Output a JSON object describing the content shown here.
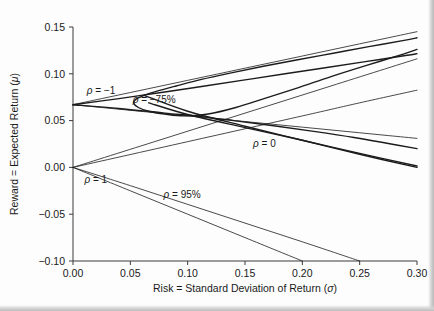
{
  "figure": {
    "background": "#fdfdfd",
    "curve_color": "#1c1c1c"
  },
  "chart_data": {
    "type": "line",
    "title": "",
    "subtitle": "",
    "xlabel": "Risk = Standard Deviation of Return (σ)",
    "ylabel": "Reward = Expected Return (μ)",
    "xlim": [
      0.0,
      0.3
    ],
    "ylim": [
      -0.1,
      0.15
    ],
    "xticks": [
      0.0,
      0.05,
      0.1,
      0.15,
      0.2,
      0.25,
      0.3
    ],
    "xtick_labels": [
      "0.00",
      "0.05",
      "0.10",
      "0.15",
      "0.20",
      "0.25",
      "0.30"
    ],
    "yticks": [
      -0.1,
      -0.05,
      0.0,
      0.05,
      0.1,
      0.15
    ],
    "ytick_labels": [
      "-0.10",
      "-0.05",
      "0.00",
      "0.05",
      "0.10",
      "0.15"
    ],
    "grid": false,
    "legend": "inline-annotations",
    "assets": {
      "asset_a": {
        "sigma": 0.2,
        "mu": 0.067
      },
      "asset_b": {
        "sigma": 0.25,
        "mu": 0.115
      }
    },
    "annotations": [
      {
        "text": "ρ = −1",
        "x": 0.012,
        "y": 0.078,
        "rho": -1.0
      },
      {
        "text": "ρ = −75%",
        "x": 0.052,
        "y": 0.069,
        "rho": -0.75
      },
      {
        "text": "ρ = 0",
        "x": 0.157,
        "y": 0.022,
        "rho": 0.0
      },
      {
        "text": "ρ = 1",
        "x": 0.01,
        "y": -0.017,
        "rho": 1.0
      },
      {
        "text": "ρ = 95%",
        "x": 0.079,
        "y": -0.033,
        "rho": 0.95
      }
    ],
    "series": [
      {
        "name": "rho = -1 upper frontier",
        "rho": -1.0,
        "x": [
          0.0,
          0.025,
          0.05,
          0.075,
          0.1,
          0.125,
          0.15,
          0.175,
          0.2,
          0.225,
          0.25,
          0.275,
          0.3
        ],
        "y": [
          0.067,
          0.0735,
          0.08,
          0.0865,
          0.093,
          0.0995,
          0.106,
          0.1125,
          0.119,
          0.1255,
          0.132,
          0.1385,
          0.145
        ]
      },
      {
        "name": "rho = -1 lower frontier",
        "rho": -1.0,
        "x": [
          0.0,
          0.025,
          0.05,
          0.075,
          0.1,
          0.125,
          0.15,
          0.175,
          0.2,
          0.225,
          0.25,
          0.275,
          0.3
        ],
        "y": [
          0.067,
          0.064,
          0.061,
          0.058,
          0.055,
          0.052,
          0.049,
          0.046,
          0.043,
          0.04,
          0.037,
          0.034,
          0.031
        ]
      },
      {
        "name": "rho = -75% frontier",
        "rho": -0.75,
        "x": [
          0.062,
          0.055,
          0.053,
          0.057,
          0.066,
          0.08,
          0.097,
          0.118,
          0.142,
          0.168,
          0.196,
          0.225,
          0.256,
          0.288,
          0.3
        ],
        "y": [
          0.077,
          0.073,
          0.0685,
          0.064,
          0.06,
          0.057,
          0.055,
          0.057,
          0.064,
          0.074,
          0.085,
          0.097,
          0.109,
          0.121,
          0.126
        ]
      },
      {
        "name": "rho = -75% upper branch",
        "rho": -0.75,
        "x": [
          0.062,
          0.072,
          0.09,
          0.112,
          0.138,
          0.166,
          0.196,
          0.227,
          0.258,
          0.29,
          0.3
        ],
        "y": [
          0.077,
          0.081,
          0.087,
          0.094,
          0.101,
          0.108,
          0.115,
          0.122,
          0.129,
          0.136,
          0.1385
        ]
      },
      {
        "name": "rho = 0 frontier",
        "rho": 0.0,
        "x": [
          0.0,
          0.04,
          0.08,
          0.11,
          0.14,
          0.175,
          0.21,
          0.245,
          0.275,
          0.3
        ],
        "y": [
          0.067,
          0.063,
          0.058,
          0.0545,
          0.05,
          0.0445,
          0.0385,
          0.032,
          0.0255,
          0.02
        ]
      },
      {
        "name": "rho = 0 upper branch",
        "rho": 0.0,
        "x": [
          0.0,
          0.04,
          0.08,
          0.115,
          0.15,
          0.185,
          0.22,
          0.255,
          0.29,
          0.3
        ],
        "y": [
          0.067,
          0.0735,
          0.0805,
          0.087,
          0.0935,
          0.1,
          0.1065,
          0.113,
          0.1195,
          0.1215
        ]
      },
      {
        "name": "rho = 1 upper line",
        "rho": 1.0,
        "x": [
          0.0,
          0.1,
          0.2,
          0.25,
          0.3
        ],
        "y": [
          0.0,
          0.0275,
          0.055,
          0.069,
          0.0825
        ]
      },
      {
        "name": "rho = 1 lower line",
        "rho": 1.0,
        "x": [
          0.0,
          0.05,
          0.1,
          0.15,
          0.2
        ],
        "y": [
          0.0,
          -0.025,
          -0.05,
          -0.075,
          -0.1
        ]
      },
      {
        "name": "rho = 95% lower branch",
        "rho": 0.95,
        "x": [
          0.0,
          0.05,
          0.1,
          0.15,
          0.2,
          0.25
        ],
        "y": [
          0.0,
          -0.0195,
          -0.0395,
          -0.0595,
          -0.0795,
          -0.1
        ]
      },
      {
        "name": "rho = 95% upper branch",
        "rho": 0.95,
        "x": [
          0.0,
          0.075,
          0.15,
          0.225,
          0.3
        ],
        "y": [
          0.0,
          0.029,
          0.058,
          0.087,
          0.116
        ]
      },
      {
        "name": "cross branch descending A",
        "rho": 0.0,
        "x": [
          0.062,
          0.1,
          0.15,
          0.2,
          0.25,
          0.3
        ],
        "y": [
          0.077,
          0.06,
          0.044,
          0.029,
          0.014,
          0.0
        ]
      },
      {
        "name": "cross branch descending B",
        "rho": -0.75,
        "x": [
          0.066,
          0.1,
          0.15,
          0.2,
          0.25,
          0.3
        ],
        "y": [
          0.069,
          0.0565,
          0.0425,
          0.029,
          0.015,
          0.0015
        ]
      }
    ]
  }
}
